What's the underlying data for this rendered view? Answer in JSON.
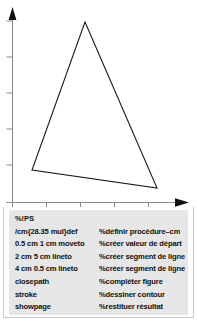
{
  "figure": {
    "kind": "postscript-triangle-example",
    "plot": {
      "background": "#ffffff",
      "axis_color": "#7a7a7a",
      "stroke_color": "#1a1a1a",
      "x_axis": {
        "label": "",
        "ticks": [
          12,
          46,
          80,
          114,
          148
        ],
        "arrow": true,
        "baseline_y": 202,
        "end_x": 188
      },
      "y_axis": {
        "label": "",
        "ticks": [
          21,
          57,
          93,
          129,
          165
        ],
        "arrow": true,
        "baseline_x": 12,
        "end_y": 8
      },
      "triangle": {
        "name": "triangle-path",
        "points": "85,22 157,188 32,170",
        "closed": true,
        "fill": "none",
        "stroke": "#1a1a1a",
        "stroke_width": 1.1
      }
    },
    "listing": {
      "background": "#e6e6e6",
      "header": "%!PS",
      "rows": [
        {
          "code": "/cm{28.35 mul}def",
          "comment": "%définir procédure–cm"
        },
        {
          "code": "0.5 cm 1 cm moveto",
          "comment": "%créer valeur de départ"
        },
        {
          "code": "2 cm 5 cm lineto",
          "comment": "%créer segment de ligne"
        },
        {
          "code": "4 cm 0.5 cm lineto",
          "comment": "%créer segment de ligne"
        },
        {
          "code": "closepath",
          "comment": "%compléter figure"
        },
        {
          "code": "stroke",
          "comment": "%dessiner contour"
        },
        {
          "code": "showpage",
          "comment": "%restituer résultat"
        }
      ]
    }
  }
}
